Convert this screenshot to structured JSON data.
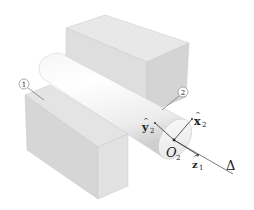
{
  "diagram": {
    "labels": {
      "body1": "1",
      "body2": "2",
      "origin": "O",
      "origin_sub": "2",
      "x_axis": "x",
      "x_sub": "2",
      "y_axis": "y",
      "y_sub": "2",
      "z_axis": "z",
      "z_sub": "1",
      "axis_line": "Δ",
      "hat": "^"
    },
    "colors": {
      "block_top": "#e4e4e4",
      "block_front": "#d2d2d2",
      "block_side": "#dcdcdc",
      "cylinder_light": "#ffffff",
      "cylinder_shadow": "#d8d8d8",
      "line": "#333333"
    }
  }
}
